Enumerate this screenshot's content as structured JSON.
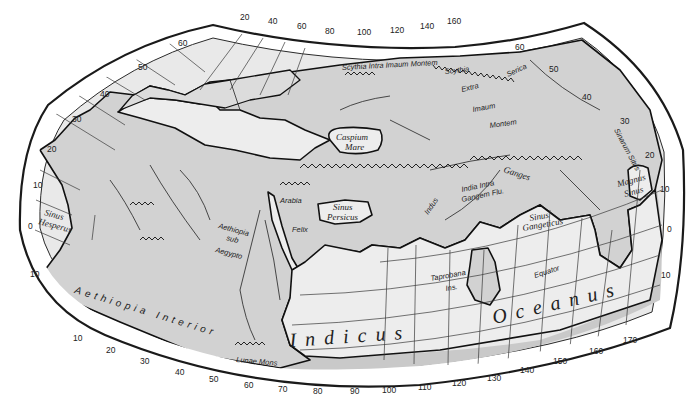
{
  "map": {
    "title": "Ptolemaic World Map",
    "colors": {
      "land": "#d2d2d2",
      "sea": "#ededed",
      "border": "#111111",
      "background": "#ffffff"
    },
    "longitude_ticks_top": [
      "20",
      "40",
      "60",
      "80",
      "100",
      "120",
      "140",
      "160"
    ],
    "longitude_ticks_bottom": [
      "10",
      "20",
      "30",
      "40",
      "50",
      "60",
      "70",
      "80",
      "90",
      "100",
      "110",
      "120",
      "130",
      "140",
      "150",
      "160",
      "170"
    ],
    "latitude_ticks_left": [
      "60",
      "50",
      "40",
      "30",
      "20",
      "10",
      "0",
      "10"
    ],
    "latitude_ticks_right": [
      "60",
      "50",
      "40",
      "30",
      "20",
      "10",
      "0",
      "10"
    ],
    "labels": {
      "scythia_intra": "Scythia Intra Imaum Montem",
      "scythia_extra_1": "Scythia",
      "scythia_extra_2": "Extra",
      "scythia_extra_3": "Imaum",
      "scythia_extra_4": "Montem",
      "serica": "Serica",
      "caspium_1": "Caspium",
      "caspium_2": "Mare",
      "sinus_persicus_1": "Sinus",
      "sinus_persicus_2": "Persicus",
      "arabia": "Arabia",
      "felix": "Felix",
      "indus": "Indus",
      "ganges": "Ganges",
      "india_1": "India Intra",
      "india_2": "Gangem Flu.",
      "sinus_gangeticus_1": "Sinus",
      "sinus_gangeticus_2": "Gangeticus",
      "magnus_sinus_1": "Magnus",
      "magnus_sinus_2": "Sinus",
      "sinarum_situs": "Sinarum Situs",
      "sinus_hesperus_1": "Sinus",
      "sinus_hesperus_2": "Hesperus",
      "aethiopia_sub_1": "Aethiopia",
      "aethiopia_sub_2": "sub",
      "aethiopia_sub_3": "Aegypto",
      "aethiopia_interior_1": "Aethiopia",
      "aethiopia_interior_2": "Interior",
      "lunae_mons": "Lunae Mons",
      "taprobana_1": "Taprobana",
      "taprobana_2": "Ins.",
      "equator": "Equator",
      "indicus": "Indicus",
      "oceanus": "Oceanus"
    }
  }
}
